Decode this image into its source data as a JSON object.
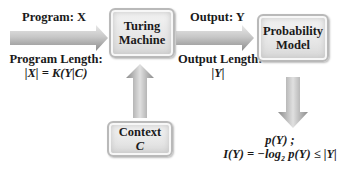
{
  "nodes": {
    "turing_machine": {
      "line1": "Turing",
      "line2": "Machine"
    },
    "probability_model": {
      "line1": "Probability",
      "line2": "Model"
    },
    "context": {
      "line1": "Context",
      "line2": "C"
    }
  },
  "edges": {
    "input_to_turing": {
      "label_top": "Program: X",
      "label_bottom_1": "Program Length:",
      "label_bottom_2": "|X| = K(Y|C)"
    },
    "turing_to_model": {
      "label_top": "Output: Y",
      "label_bottom_1": "Output Length:",
      "label_bottom_2": "|Y|"
    },
    "context_to_turing": {},
    "model_to_output": {}
  },
  "output": {
    "line1": "p(Y) ;",
    "line2": "I(Y)  = −log₂ p(Y) ≤ |Y|"
  },
  "colors": {
    "arrow_light": "#d9d9d9",
    "arrow_dark": "#8a8a8a",
    "box_fill": "#e6e6e6",
    "box_border": "#b9b9b9"
  }
}
